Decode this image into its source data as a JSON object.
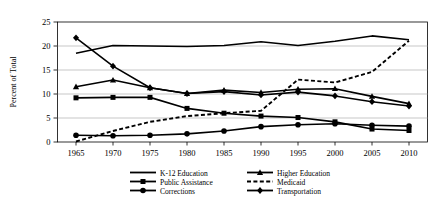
{
  "chart_data": {
    "type": "line",
    "title": "",
    "xlabel": "",
    "ylabel": "Percent of Total",
    "x": [
      1965,
      1970,
      1975,
      1980,
      1985,
      1990,
      1995,
      2000,
      2005,
      2010
    ],
    "xticklabels": [
      "1965",
      "1970",
      "1975",
      "1980",
      "1985",
      "1990",
      "1995",
      "2000",
      "2005",
      "2010"
    ],
    "yticklabels": [
      "0",
      "5",
      "10",
      "15",
      "20",
      "25"
    ],
    "yticks": [
      0,
      5,
      10,
      15,
      20,
      25
    ],
    "ylim": [
      0,
      25
    ],
    "xlim": [
      1963,
      2012
    ],
    "grid": "horizontal",
    "legend_position": "below",
    "series": [
      {
        "name": "K-12 Education",
        "marker": "none",
        "dash": "solid",
        "color": "#000000",
        "values": [
          18.5,
          20.1,
          20.0,
          19.9,
          20.1,
          20.9,
          20.1,
          21.0,
          22.1,
          21.3
        ]
      },
      {
        "name": "Public Assistance",
        "marker": "square",
        "dash": "solid",
        "color": "#000000",
        "values": [
          9.2,
          9.3,
          9.3,
          7.0,
          6.0,
          5.4,
          5.1,
          4.2,
          2.7,
          2.4
        ]
      },
      {
        "name": "Corrections",
        "marker": "circle",
        "dash": "solid",
        "color": "#000000",
        "values": [
          1.4,
          1.3,
          1.4,
          1.7,
          2.3,
          3.2,
          3.6,
          3.8,
          3.5,
          3.3
        ]
      },
      {
        "name": "Higher Education",
        "marker": "triangle",
        "dash": "solid",
        "color": "#000000",
        "values": [
          11.5,
          12.9,
          11.3,
          10.1,
          10.8,
          10.3,
          11.0,
          11.1,
          9.5,
          8.0
        ]
      },
      {
        "name": "Medicaid",
        "marker": "none",
        "dash": "dashed",
        "color": "#000000",
        "values": [
          0.1,
          2.3,
          4.2,
          5.4,
          6.0,
          6.5,
          13.0,
          12.4,
          14.6,
          21.1
        ]
      },
      {
        "name": "Transportation",
        "marker": "diamond",
        "dash": "solid",
        "color": "#000000",
        "values": [
          21.7,
          15.8,
          11.3,
          10.1,
          10.5,
          9.8,
          10.4,
          9.6,
          8.4,
          7.5
        ]
      }
    ]
  }
}
